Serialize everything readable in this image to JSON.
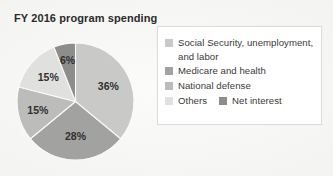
{
  "chart_data": {
    "type": "pie",
    "title": "FY 2016 program spending",
    "categories": [
      "Social Security, unemployment, and labor",
      "Medicare and health",
      "National defense",
      "Others",
      "Net interest"
    ],
    "values": [
      36,
      28,
      15,
      15,
      6
    ],
    "value_labels": [
      "36%",
      "28%",
      "15%",
      "15%",
      "6%"
    ],
    "colors": [
      "#c9c9c7",
      "#a2a2a0",
      "#bcbcba",
      "#e0e0de",
      "#8d8d8b"
    ],
    "start_angle_deg": 0,
    "direction": "clockwise",
    "legend_position": "right",
    "grid": false,
    "xlabel": "",
    "ylabel": ""
  },
  "figure": {
    "title": "FY 2016 program spending",
    "background_color": "#f2f2f0"
  },
  "pie": {
    "slices": [
      {
        "label": "36%",
        "value": 36,
        "color": "#c9c9c7",
        "name": "Social Security, unemployment, and labor"
      },
      {
        "label": "28%",
        "value": 28,
        "color": "#a2a2a0",
        "name": "Medicare and health"
      },
      {
        "label": "15%",
        "value": 15,
        "color": "#bcbcba",
        "name": "National defense"
      },
      {
        "label": "15%",
        "value": 15,
        "color": "#e0e0de",
        "name": "Others"
      },
      {
        "label": "6%",
        "value": 6,
        "color": "#8d8d8b",
        "name": "Net interest"
      }
    ]
  },
  "legend": {
    "items": [
      {
        "label": "Social Security, unemployment,\nand labor",
        "color": "#c9c9c7"
      },
      {
        "label": "Medicare and health",
        "color": "#a2a2a0"
      },
      {
        "label": "National defense",
        "color": "#bcbcba"
      },
      {
        "label": "Others",
        "color": "#e0e0de"
      },
      {
        "label": "Net interest",
        "color": "#8d8d8b"
      }
    ]
  }
}
